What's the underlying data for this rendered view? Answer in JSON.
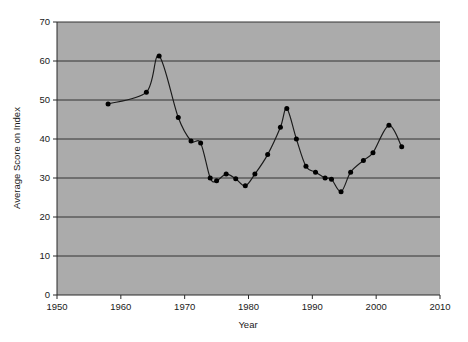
{
  "chart_data": {
    "type": "line",
    "title": "",
    "subtitle": "",
    "xlabel": "Year",
    "ylabel": "Average Score on Index",
    "xlim": [
      1950,
      2010
    ],
    "ylim": [
      0,
      70
    ],
    "xticks": [
      1950,
      1960,
      1970,
      1980,
      1990,
      2000,
      2010
    ],
    "xtick_labels": [
      "1950",
      "1960",
      "1970",
      "1980",
      "1990",
      "2000",
      "2010"
    ],
    "yticks": [
      0,
      10,
      20,
      30,
      40,
      50,
      60,
      70
    ],
    "ytick_labels": [
      "0",
      "10",
      "20",
      "30",
      "40",
      "50",
      "60",
      "70"
    ],
    "grid": "horizontal",
    "legend": "none",
    "plot_background": "#ababab",
    "line_color": "#1a1a1a",
    "marker_color": "#000000",
    "marker_style": "filled-circle",
    "series": [
      {
        "name": "Average Score on Index",
        "x": [
          1958,
          1964,
          1966,
          1969,
          1971,
          1972.5,
          1974,
          1975,
          1976.5,
          1978,
          1979.5,
          1981,
          1983,
          1985,
          1986,
          1987.5,
          1989,
          1990.5,
          1992,
          1993,
          1994.5,
          1996,
          1998,
          1999.5,
          2002,
          2004
        ],
        "values": [
          49,
          52,
          61.3,
          45.5,
          39.5,
          39,
          30,
          29.3,
          31,
          29.8,
          28,
          31,
          36,
          43,
          47.8,
          40,
          33,
          31.5,
          30,
          29.7,
          26.5,
          31.5,
          34.5,
          36.5,
          43.5,
          38
        ]
      }
    ]
  }
}
